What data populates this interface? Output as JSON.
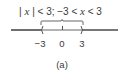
{
  "expression": {
    "part1_bar_open": "| ",
    "part1_var": "x",
    "part1_rest": " | < 3;  −3 < ",
    "part2_var": "x",
    "part2_rest": " < 3"
  },
  "number_line": {
    "tick_labels": [
      "−3",
      "0",
      "3"
    ],
    "interval": "open",
    "left_endpoint": -3,
    "right_endpoint": 3,
    "center": 0
  },
  "caption": "(a)",
  "colors": {
    "line": "#4a4a4a",
    "highlight_segment": "#9a9a9a",
    "text": "#3a3a3a"
  }
}
